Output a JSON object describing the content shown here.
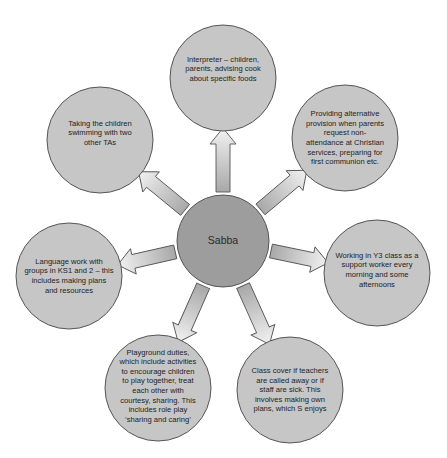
{
  "diagram": {
    "type": "spider-diagram",
    "colors": {
      "center_fill": "#9d9d9d",
      "node_fill": "#c6c6c6",
      "outline": "#555555",
      "arrow_start": "#a8a8a8",
      "arrow_end": "#f2f2f2",
      "text": "#222222",
      "background": "#ffffff"
    },
    "center": {
      "label": "Sabba",
      "cx": 223,
      "cy": 241,
      "r": 46
    },
    "nodes": [
      {
        "id": "interpreter",
        "label": "Interpreter – children,\nparents, advising cook\nabout specific foods",
        "cx": 223,
        "cy": 78,
        "r": 53
      },
      {
        "id": "alternative-provision",
        "label": "Providing alternative\nprovision when parents\nrequest non-\nattendance at Christian\nservices, preparing for\nfirst communion etc.",
        "cx": 345,
        "cy": 138,
        "r": 53
      },
      {
        "id": "working-y3",
        "label": "Working in Y3 class as a\nsupport worker every\nmorning and some\nafternoons",
        "cx": 377,
        "cy": 273,
        "r": 53
      },
      {
        "id": "class-cover",
        "label": "Class cover if teachers\nare called away or if\nstaff are sick. This\ninvolves making own\nplans, which S enjoys",
        "cx": 290,
        "cy": 390,
        "r": 53
      },
      {
        "id": "playground-duties",
        "label": "Playground duties,\nwhich include activities\nto encourage children\nto play together, treat\neach other with\ncourtesy, sharing. This\nincludes role play\n‘sharing and caring’",
        "cx": 158,
        "cy": 388,
        "r": 53
      },
      {
        "id": "language-work",
        "label": "Language work with\ngroups in KS1 and 2 – this\nincludes making plans\nand resources",
        "cx": 69,
        "cy": 276,
        "r": 53
      },
      {
        "id": "swimming",
        "label": "Taking the children\nswimming with two\nother TAs",
        "cx": 100,
        "cy": 140,
        "r": 53
      }
    ]
  }
}
